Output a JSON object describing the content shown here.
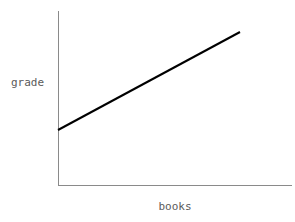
{
  "chart_data": {
    "type": "line",
    "title": "",
    "subtitle": "",
    "xlabel": "books",
    "ylabel": "grade",
    "xlim": [
      0,
      1
    ],
    "ylim": [
      0,
      1
    ],
    "grid": false,
    "legend": null,
    "xticks": [],
    "yticks": [],
    "xticklabels": [],
    "yticklabels": [],
    "annotations": [],
    "series": [
      {
        "name": "grade vs books",
        "color": "#000000",
        "linewidth": 2,
        "x": [
          0.0,
          1.0
        ],
        "y": [
          0.315,
          0.879
        ],
        "points_px": [
          [
            58,
            130
          ],
          [
            240,
            32
          ]
        ],
        "description": "straight line with positive slope, rising left to right"
      }
    ],
    "axes_style": {
      "spines": [
        "left",
        "bottom"
      ],
      "axis_color": "#8a8a8a",
      "axis_linewidth": 1,
      "background": "#ffffff",
      "label_color": "#5a5a5a",
      "label_font_size_px": 11
    }
  },
  "labels": {
    "y_axis": "grade",
    "x_axis": "books"
  }
}
